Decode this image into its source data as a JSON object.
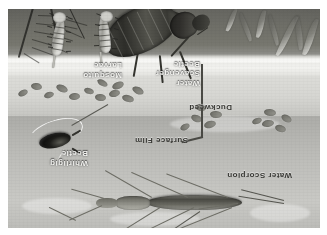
{
  "figure": {
    "orientation_note": "printed upside-down (rotated 180 degrees)",
    "medium": "grayscale ink and wash illustration",
    "background_color": "#ffffff",
    "plate_border_color": "#cfcfcb"
  },
  "zones": [
    {
      "id": "above-water",
      "name": "Open water / pond bottom wash",
      "color": "#d6d6d2"
    },
    {
      "id": "surface-film",
      "name": "Surface film meniscus line",
      "color": "#fbfbf9"
    },
    {
      "id": "underwater",
      "name": "Underwater weed bed",
      "color": "#6e6e67"
    }
  ],
  "labels": [
    {
      "id": "mosquito-larvae",
      "text": "Mosquito\nLarvae",
      "tone": "light"
    },
    {
      "id": "water-scavenger-beetle",
      "text": "Water\nScavenger\nBeetle",
      "tone": "light"
    },
    {
      "id": "whirligig-beetle",
      "text": "Whirligig\nBeetle",
      "tone": "light"
    },
    {
      "id": "surface-film",
      "text": "Surface Film",
      "tone": "dark"
    },
    {
      "id": "duckweed",
      "text": "Duckweed",
      "tone": "dark"
    },
    {
      "id": "water-scorpion",
      "text": "Water Scorpion",
      "tone": "dark"
    }
  ],
  "organisms": [
    {
      "id": "mosquito-larva-1",
      "name": "Mosquito larva",
      "count": 2
    },
    {
      "id": "water-scavenger-beetle",
      "name": "Water scavenger beetle",
      "count": 1
    },
    {
      "id": "whirligig-beetle",
      "name": "Whirligig beetle",
      "count": 1
    },
    {
      "id": "water-scorpion",
      "name": "Water scorpion",
      "count": 1
    },
    {
      "id": "duckweed",
      "name": "Duckweed fronds",
      "count": 22
    }
  ],
  "palette": {
    "paper": "#ffffff",
    "water_light": "#dededa",
    "water_mid": "#c6c6c2",
    "weed_dark": "#6e6e67",
    "ink": "#1d1d1a",
    "label_light": "#ffffff",
    "label_dark": "#3a3a36"
  }
}
